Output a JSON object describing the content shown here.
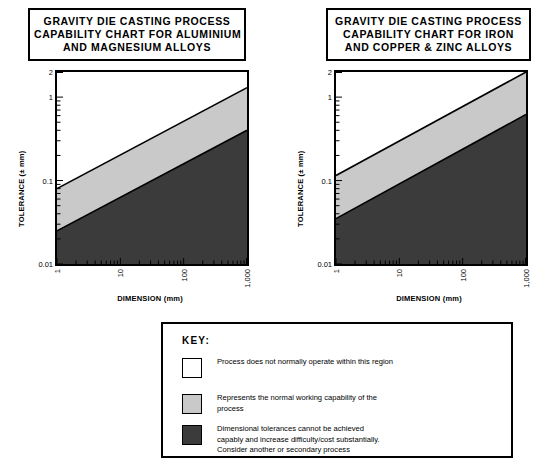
{
  "charts": [
    {
      "id": "aluminium-magnesium",
      "title_lines": [
        "GRAVITY DIE CASTING PROCESS",
        "CAPABILITY CHART FOR ALUMINIUM",
        "AND MAGNESIUM ALLOYS"
      ],
      "xlabel": "DIMENSION (mm)",
      "ylabel": "TOLERANCE (± mm)",
      "xticks": [
        "1",
        "10",
        "100",
        "1,000"
      ],
      "yticks": [
        "2",
        "1",
        "0.1",
        "0.01"
      ]
    },
    {
      "id": "iron-copper-zinc",
      "title_lines": [
        "GRAVITY DIE CASTING PROCESS",
        "CAPABILITY CHART FOR IRON",
        "AND COPPER & ZINC ALLOYS"
      ],
      "xlabel": "DIMENSION (mm)",
      "ylabel": "TOLERANCE (± mm)",
      "xticks": [
        "1",
        "10",
        "100",
        "1,000"
      ],
      "yticks": [
        "2",
        "1",
        "0.1",
        "0.01"
      ]
    }
  ],
  "key": {
    "heading": "KEY:",
    "items": [
      {
        "swatch": "#ffffff",
        "text": "Process does not normally operate within this region"
      },
      {
        "swatch": "#c9c9c9",
        "text": "Represents the normal working capability of the\nprocess"
      },
      {
        "swatch": "#3b3b3b",
        "text": "Dimensional tolerances cannot be achieved\ncapably and increase difficulty/cost substantially.\nConsider another or secondary process"
      }
    ]
  },
  "colors": {
    "white_region": "#ffffff",
    "normal_band": "#c9c9c9",
    "difficult_region": "#3b3b3b",
    "frame": "#000000"
  },
  "chart_data": [
    {
      "type": "area",
      "title": "GRAVITY DIE CASTING PROCESS CAPABILITY CHART FOR ALUMINIUM AND MAGNESIUM ALLOYS",
      "xlabel": "DIMENSION (mm)",
      "ylabel": "TOLERANCE (± mm)",
      "xscale": "log",
      "yscale": "log",
      "xlim": [
        1,
        1000
      ],
      "ylim": [
        0.01,
        2
      ],
      "xticks": [
        1,
        10,
        100,
        1000
      ],
      "xticklabels": [
        "1",
        "10",
        "100",
        "1,000"
      ],
      "yticks": [
        0.01,
        0.1,
        1,
        2
      ],
      "yticklabels": [
        "0.01",
        "0.1",
        "1",
        "2"
      ],
      "grid": false,
      "legend": "external key box",
      "series": [
        {
          "name": "upper boundary of normal working capability",
          "x": [
            1,
            1000
          ],
          "y": [
            0.08,
            1.3
          ]
        },
        {
          "name": "lower boundary of normal working capability",
          "x": [
            1,
            1000
          ],
          "y": [
            0.025,
            0.4
          ]
        }
      ],
      "regions": [
        {
          "name": "Process does not normally operate within this region",
          "fill": "#ffffff",
          "location": "above upper boundary"
        },
        {
          "name": "Represents the normal working capability of the process",
          "fill": "#c9c9c9",
          "location": "between upper and lower boundary"
        },
        {
          "name": "Dimensional tolerances cannot be achieved capably and increase difficulty/cost substantially. Consider another or secondary process",
          "fill": "#3b3b3b",
          "location": "below lower boundary"
        }
      ]
    },
    {
      "type": "area",
      "title": "GRAVITY DIE CASTING PROCESS CAPABILITY CHART FOR IRON AND COPPER & ZINC ALLOYS",
      "xlabel": "DIMENSION (mm)",
      "ylabel": "TOLERANCE (± mm)",
      "xscale": "log",
      "yscale": "log",
      "xlim": [
        1,
        1000
      ],
      "ylim": [
        0.01,
        2
      ],
      "xticks": [
        1,
        10,
        100,
        1000
      ],
      "xticklabels": [
        "1",
        "10",
        "100",
        "1,000"
      ],
      "yticks": [
        0.01,
        0.1,
        1,
        2
      ],
      "yticklabels": [
        "0.01",
        "0.1",
        "1",
        "2"
      ],
      "grid": false,
      "legend": "external key box",
      "series": [
        {
          "name": "upper boundary of normal working capability",
          "x": [
            1,
            1000
          ],
          "y": [
            0.115,
            2.0
          ]
        },
        {
          "name": "lower boundary of normal working capability",
          "x": [
            1,
            1000
          ],
          "y": [
            0.035,
            0.62
          ]
        }
      ],
      "regions": [
        {
          "name": "Process does not normally operate within this region",
          "fill": "#ffffff",
          "location": "above upper boundary"
        },
        {
          "name": "Represents the normal working capability of the process",
          "fill": "#c9c9c9",
          "location": "between upper and lower boundary"
        },
        {
          "name": "Dimensional tolerances cannot be achieved capably and increase difficulty/cost substantially. Consider another or secondary process",
          "fill": "#3b3b3b",
          "location": "below lower boundary"
        }
      ]
    }
  ]
}
